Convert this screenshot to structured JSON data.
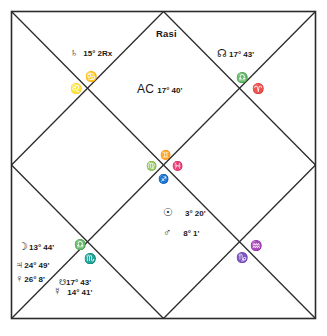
{
  "chart": {
    "title": "Rasi",
    "type": "vedic-north-indian-rasi-chart",
    "ascendant": {
      "label": "AC",
      "degree": "17° 40'"
    },
    "planets": [
      {
        "name": "saturn",
        "glyph": "♄",
        "degree": "15°  2Rx"
      },
      {
        "name": "rahu",
        "glyph": "☊",
        "degree": "17° 43'"
      },
      {
        "name": "sun",
        "glyph": "☉",
        "degree": "3° 20'"
      },
      {
        "name": "mars",
        "glyph": "♂",
        "degree": "8°  1'"
      },
      {
        "name": "moon",
        "glyph": "☽",
        "degree": "13° 44'"
      },
      {
        "name": "jupiter",
        "glyph": "♃",
        "degree": "24° 49'"
      },
      {
        "name": "venus",
        "glyph": "♀",
        "degree": "26°  8'"
      },
      {
        "name": "ketu",
        "glyph": "☋",
        "degree": "17° 43'"
      },
      {
        "name": "mercury",
        "glyph": "☿",
        "degree": "14° 41'"
      }
    ],
    "signs": [
      {
        "name": "cancer",
        "glyph": "♋"
      },
      {
        "name": "leo",
        "glyph": "♌"
      },
      {
        "name": "libra-upper",
        "glyph": "♎"
      },
      {
        "name": "aries",
        "glyph": "♈"
      },
      {
        "name": "gemini",
        "glyph": "♊"
      },
      {
        "name": "virgo",
        "glyph": "♍"
      },
      {
        "name": "pisces",
        "glyph": "♓"
      },
      {
        "name": "sagittarius",
        "glyph": "♐"
      },
      {
        "name": "libra",
        "glyph": "♎"
      },
      {
        "name": "scorpio",
        "glyph": "♏"
      },
      {
        "name": "aquarius",
        "glyph": "♒"
      },
      {
        "name": "capricorn",
        "glyph": "♑"
      }
    ],
    "colors": {
      "ink": "#151515",
      "background": "#ffffff",
      "line": "#2b2b2b"
    }
  }
}
